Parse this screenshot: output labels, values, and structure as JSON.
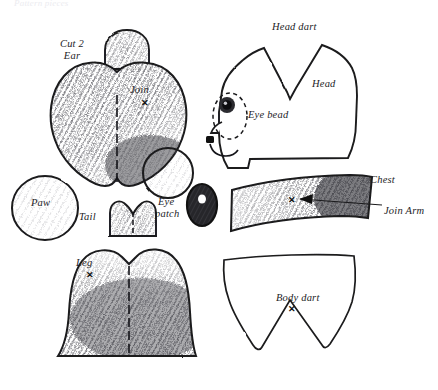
{
  "document": {
    "type": "sewing-pattern-diagram",
    "subject": "stuffed toy cat pattern pieces",
    "background_color": "#ffffff",
    "ink_color": "#1d1d1f",
    "pencil_shading_color": "#6e6e74"
  },
  "header": {
    "cut_off_caption": "Pattern pieces"
  },
  "labels": {
    "cut_2": "Cut 2",
    "ear": "Ear",
    "join": "Join",
    "head_dart": "Head dart",
    "head": "Head",
    "eye_bead": "Eye bead",
    "chest": "Chest",
    "join_arm": "Join Arm",
    "paw": "Paw",
    "tail": "Tail",
    "eye_patch_line1": "Eye",
    "eye_patch_line2": "patch",
    "leg": "Leg",
    "body_dart": "Body dart"
  },
  "marks": {
    "x_symbol": "✕"
  },
  "pieces": [
    {
      "name": "ear",
      "label": "Ear",
      "quantity_note": "Cut 2",
      "shape": "dome",
      "shaded": true
    },
    {
      "name": "body",
      "label": "Join",
      "shape": "heart",
      "shaded": true,
      "has_center_dart": true,
      "has_circle_overlay": true,
      "has_x_mark": true
    },
    {
      "name": "head",
      "label": "Head",
      "shape": "cat-head-profile",
      "shaded": false,
      "has_dart": true,
      "dart_label": "Head dart",
      "detail": "Eye bead"
    },
    {
      "name": "chest",
      "label": "Chest",
      "shape": "curved-band",
      "shaded": true,
      "has_x_mark": true,
      "callout": "Join Arm"
    },
    {
      "name": "paw",
      "label": "Paw",
      "shape": "oval",
      "shaded": true
    },
    {
      "name": "tail",
      "label": "Tail",
      "shape": "heart-top-rect",
      "shaded": true,
      "has_center_dart": true
    },
    {
      "name": "eye-patch",
      "label": "Eye patch",
      "shape": "oval-dark",
      "shaded": true,
      "has_center_hole": true
    },
    {
      "name": "leg",
      "label": "Leg",
      "shape": "wide-heart-base",
      "shaded": true,
      "has_center_dart": true,
      "has_x_mark": true
    },
    {
      "name": "body-lower",
      "label": "Body dart",
      "shape": "shield-double-point",
      "shaded": false,
      "has_dart": true
    }
  ]
}
